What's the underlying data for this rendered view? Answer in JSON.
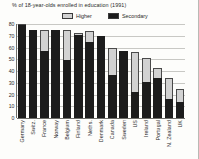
{
  "chart_data": {
    "type": "bar",
    "title": "% of 18-year-olds enrolled in education (1991)",
    "xlabel": "",
    "ylabel": "",
    "ylim": [
      0,
      80
    ],
    "yticks": [
      0,
      10,
      20,
      30,
      40,
      50,
      60,
      70,
      80
    ],
    "grid": true,
    "stacked": true,
    "legend_position": "top-center",
    "categories": [
      "Germany",
      "Switz.",
      "France",
      "Norway",
      "Belgium",
      "Finland",
      "Neths.",
      "Denmark",
      "Canada",
      "Sweden",
      "US",
      "Ireland",
      "Portugal",
      "N. Zealand",
      "UK"
    ],
    "series": [
      {
        "name": "Secondary",
        "color": "#1c1c1c",
        "values": [
          79,
          75,
          57,
          75,
          49,
          71,
          65,
          70,
          37,
          57,
          22,
          31,
          34,
          16,
          14
        ]
      },
      {
        "name": "Higher",
        "color": "#d2d2d2",
        "values": [
          1,
          0,
          18,
          0,
          26,
          1,
          9,
          0,
          23,
          0,
          34,
          20,
          9,
          18,
          11
        ]
      }
    ],
    "totals": [
      80,
      75,
      75,
      75,
      75,
      72,
      74,
      70,
      60,
      57,
      56,
      51,
      43,
      34,
      25
    ]
  },
  "legend": {
    "entries": [
      {
        "label": "Higher",
        "swatch": "higher-swatch"
      },
      {
        "label": "Secondary",
        "swatch": "secondary-swatch"
      }
    ]
  },
  "colors": {
    "higher": "#d2d2d2",
    "secondary": "#1c1c1c",
    "grid": "#c8c8c4",
    "axis": "#6e6e6a",
    "text": "#2b2b2b",
    "background": "#fdfdfb"
  }
}
